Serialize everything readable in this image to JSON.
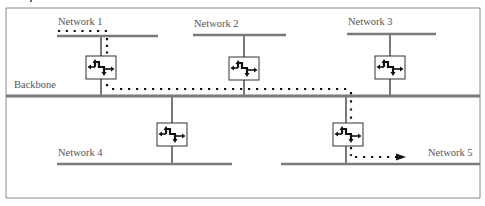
{
  "diagram": {
    "type": "network-topology",
    "colors": {
      "line": "#7a7a7a",
      "frame": "#8a8a8a",
      "router_border": "#333333",
      "router_icon": "#111111",
      "path": "#111111",
      "label": "#555555"
    },
    "labels": {
      "backbone": "Backbone",
      "network1": "Network 1",
      "network2": "Network 2",
      "network3": "Network 3",
      "network4": "Network 4",
      "network5": "Network 5"
    },
    "nodes": [
      {
        "id": "router-1",
        "kind": "router",
        "connects": [
          "Network 1",
          "Backbone"
        ]
      },
      {
        "id": "router-2",
        "kind": "router",
        "connects": [
          "Network 2",
          "Backbone"
        ]
      },
      {
        "id": "router-3",
        "kind": "router",
        "connects": [
          "Network 3",
          "Backbone"
        ]
      },
      {
        "id": "router-4",
        "kind": "router",
        "connects": [
          "Backbone",
          "Network 4"
        ]
      },
      {
        "id": "router-5",
        "kind": "router",
        "connects": [
          "Backbone",
          "Network 5"
        ]
      }
    ],
    "path": {
      "style": "dotted",
      "route": [
        "Network 1",
        "router-1",
        "Backbone",
        "router-5",
        "Network 5"
      ],
      "ends_with_arrow": true
    }
  }
}
